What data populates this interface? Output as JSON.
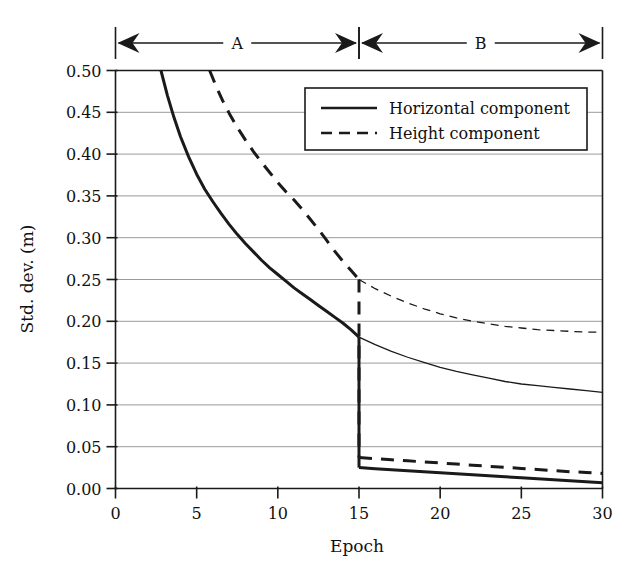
{
  "chart_data": {
    "type": "line",
    "title": "",
    "xlabel": "Epoch",
    "ylabel": "Std. dev. (m)",
    "xlim": [
      0,
      30
    ],
    "ylim": [
      0.0,
      0.5
    ],
    "xticks": [
      "0",
      "5",
      "10",
      "15",
      "20",
      "25",
      "30"
    ],
    "xtick_values": [
      0,
      5,
      10,
      15,
      20,
      25,
      30
    ],
    "yticks": [
      "0.00",
      "0.05",
      "0.10",
      "0.15",
      "0.20",
      "0.25",
      "0.30",
      "0.35",
      "0.40",
      "0.45",
      "0.50"
    ],
    "ytick_values": [
      0.0,
      0.05,
      0.1,
      0.15,
      0.2,
      0.25,
      0.3,
      0.35,
      0.4,
      0.45,
      0.5
    ],
    "grid": true,
    "grid_axis": "y",
    "legend_position": "top-right",
    "legend": [
      {
        "label": "Horizontal component",
        "style": "solid"
      },
      {
        "label": "Height component",
        "style": "dashed"
      }
    ],
    "phase_brackets": [
      {
        "label": "A",
        "from": 0,
        "to": 15
      },
      {
        "label": "B",
        "from": 15,
        "to": 30
      }
    ],
    "series": [
      {
        "name": "Horizontal component",
        "style": "solid",
        "weight": "thick",
        "segment": "A",
        "x": [
          2.8,
          3.2,
          3.6,
          4.0,
          4.5,
          5.0,
          5.5,
          6.0,
          6.5,
          7.0,
          7.5,
          8.0,
          8.5,
          9.0,
          9.5,
          10.0,
          10.5,
          11.0,
          11.5,
          12.0,
          12.5,
          13.0,
          13.5,
          14.0,
          14.5,
          15.0
        ],
        "y": [
          0.5,
          0.47,
          0.444,
          0.421,
          0.397,
          0.376,
          0.358,
          0.343,
          0.329,
          0.316,
          0.304,
          0.293,
          0.283,
          0.273,
          0.264,
          0.256,
          0.248,
          0.24,
          0.233,
          0.226,
          0.219,
          0.212,
          0.205,
          0.198,
          0.19,
          0.181
        ]
      },
      {
        "name": "Height component",
        "style": "dashed",
        "weight": "thick",
        "segment": "A",
        "x": [
          5.8,
          6.2,
          6.6,
          7.0,
          7.5,
          8.0,
          8.5,
          9.0,
          9.5,
          10.0,
          10.5,
          11.0,
          11.5,
          12.0,
          12.5,
          13.0,
          13.5,
          14.0,
          14.5,
          15.0
        ],
        "y": [
          0.5,
          0.481,
          0.464,
          0.449,
          0.432,
          0.417,
          0.403,
          0.39,
          0.378,
          0.366,
          0.355,
          0.345,
          0.334,
          0.322,
          0.31,
          0.297,
          0.284,
          0.272,
          0.261,
          0.25
        ]
      },
      {
        "name": "Horizontal component (extrapolated)",
        "style": "solid",
        "weight": "thin",
        "segment": "B",
        "x": [
          15,
          16,
          17,
          18,
          19,
          20,
          21,
          22,
          23,
          24,
          25,
          26,
          27,
          28,
          29,
          30
        ],
        "y": [
          0.181,
          0.172,
          0.164,
          0.157,
          0.151,
          0.145,
          0.14,
          0.136,
          0.132,
          0.128,
          0.125,
          0.123,
          0.121,
          0.119,
          0.117,
          0.115
        ]
      },
      {
        "name": "Height component (extrapolated)",
        "style": "dashed",
        "weight": "thin",
        "segment": "B",
        "x": [
          15,
          16,
          17,
          18,
          19,
          20,
          21,
          22,
          23,
          24,
          25,
          26,
          27,
          28,
          29,
          30
        ],
        "y": [
          0.25,
          0.239,
          0.23,
          0.222,
          0.215,
          0.209,
          0.204,
          0.2,
          0.197,
          0.194,
          0.192,
          0.19,
          0.189,
          0.188,
          0.187,
          0.187
        ]
      },
      {
        "name": "Horizontal component (phase B)",
        "style": "solid",
        "weight": "thick",
        "segment": "B",
        "x": [
          15,
          16,
          17,
          18,
          19,
          20,
          21,
          22,
          23,
          24,
          25,
          26,
          27,
          28,
          29,
          30
        ],
        "y": [
          0.025,
          0.0237,
          0.0225,
          0.0213,
          0.0201,
          0.0189,
          0.0177,
          0.0165,
          0.0153,
          0.0141,
          0.0129,
          0.0117,
          0.0106,
          0.0094,
          0.0082,
          0.007
        ]
      },
      {
        "name": "Height component (phase B)",
        "style": "dashed",
        "weight": "thick",
        "segment": "B",
        "x": [
          15,
          16,
          17,
          18,
          19,
          20,
          21,
          22,
          23,
          24,
          25,
          26,
          27,
          28,
          29,
          30
        ],
        "y": [
          0.037,
          0.0357,
          0.0344,
          0.0331,
          0.0318,
          0.0305,
          0.0292,
          0.0279,
          0.0266,
          0.0253,
          0.024,
          0.0227,
          0.0214,
          0.0201,
          0.0192,
          0.018
        ]
      }
    ],
    "drops": [
      {
        "name": "Horizontal component drop at epoch 15",
        "x": 15,
        "from": 0.181,
        "to": 0.025,
        "style": "solid"
      },
      {
        "name": "Height component drop at epoch 15",
        "x": 15,
        "from": 0.25,
        "to": 0.037,
        "style": "dashed"
      }
    ],
    "colors": {
      "line": "#1a1a1a",
      "grid": "#9a9a9a",
      "axis": "#1a1a1a",
      "background": "#ffffff"
    }
  }
}
